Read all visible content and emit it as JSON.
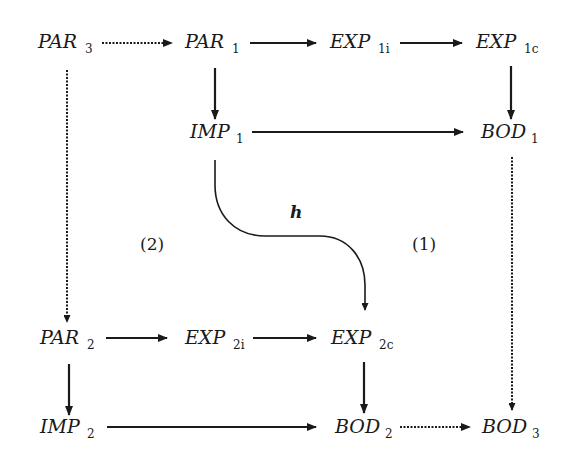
{
  "diagram": {
    "nodes": {
      "par3": {
        "base": "PAR",
        "sub": "3"
      },
      "par1": {
        "base": "PAR",
        "sub": "1"
      },
      "exp1i": {
        "base": "EXP",
        "sub": "1i"
      },
      "exp1c": {
        "base": "EXP",
        "sub": "1c"
      },
      "imp1": {
        "base": "IMP",
        "sub": "1"
      },
      "bod1": {
        "base": "BOD",
        "sub": "1"
      },
      "par2": {
        "base": "PAR",
        "sub": "2"
      },
      "exp2i": {
        "base": "EXP",
        "sub": "2i"
      },
      "exp2c": {
        "base": "EXP",
        "sub": "2c"
      },
      "imp2": {
        "base": "IMP",
        "sub": "2"
      },
      "bod2": {
        "base": "BOD",
        "sub": "2"
      },
      "bod3": {
        "base": "BOD",
        "sub": "3"
      }
    },
    "labels": {
      "h": "h",
      "region1": "(1)",
      "region2": "(2)"
    },
    "edges": [
      {
        "from": "PAR3",
        "to": "PAR1",
        "style": "dotted"
      },
      {
        "from": "PAR1",
        "to": "EXP1i",
        "style": "solid"
      },
      {
        "from": "EXP1i",
        "to": "EXP1c",
        "style": "solid"
      },
      {
        "from": "PAR1",
        "to": "IMP1",
        "style": "solid"
      },
      {
        "from": "EXP1c",
        "to": "BOD1",
        "style": "solid"
      },
      {
        "from": "IMP1",
        "to": "BOD1",
        "style": "solid"
      },
      {
        "from": "IMP1",
        "to": "EXP2c",
        "style": "curved",
        "label": "h"
      },
      {
        "from": "PAR3",
        "to": "PAR2",
        "style": "dotted"
      },
      {
        "from": "BOD1",
        "to": "BOD3",
        "style": "dotted"
      },
      {
        "from": "PAR2",
        "to": "EXP2i",
        "style": "solid"
      },
      {
        "from": "EXP2i",
        "to": "EXP2c",
        "style": "solid"
      },
      {
        "from": "PAR2",
        "to": "IMP2",
        "style": "solid"
      },
      {
        "from": "EXP2c",
        "to": "BOD2",
        "style": "solid"
      },
      {
        "from": "IMP2",
        "to": "BOD2",
        "style": "solid"
      },
      {
        "from": "BOD2",
        "to": "BOD3",
        "style": "dotted"
      }
    ]
  }
}
